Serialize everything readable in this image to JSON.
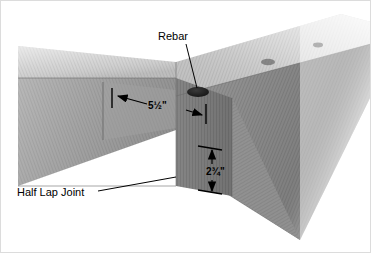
{
  "figure": {
    "title": "Corner Detail",
    "rendering": "grayscale photographic wood illustration",
    "background_color": "#ffffff",
    "border_color": "#d8d8d8"
  },
  "annotations": {
    "rebar": {
      "label": "Rebar",
      "leader": "diagonal line down-right to dark drilled hole"
    },
    "half_lap_joint": {
      "label": "Half Lap Joint",
      "leader": "horizontal line right to joint seam"
    }
  },
  "dimensions": {
    "width": {
      "value": "5½\"",
      "orientation": "horizontal",
      "arrow_style": "double-headed with end ticks"
    },
    "height": {
      "value": "2¾\"",
      "orientation": "vertical",
      "arrow_style": "double-headed with end ticks"
    }
  },
  "colors": {
    "wood_light": "#d9d9d9",
    "wood_mid": "#b0b0b0",
    "wood_dark": "#8e8e8e",
    "wood_shadow": "#787878",
    "wood_deep": "#6d6d6d",
    "hole_fill": "#1d1d1d",
    "line": "#000000",
    "title_text": "#1b1b1b"
  },
  "features": {
    "rebar_hole_count": 3,
    "beams": [
      "left beam receding to upper-left",
      "right beam receding to upper-right",
      "corner post face front-right"
    ]
  }
}
